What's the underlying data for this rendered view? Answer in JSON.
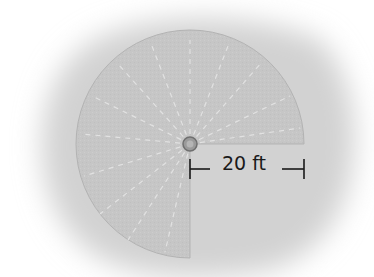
{
  "figure": {
    "shape": "three-quarter circle (270° sector), bottom-right quadrant removed",
    "radius_label": "20 ft",
    "colors": {
      "background": "#ffffff",
      "shadow": "#d2d2d2",
      "sector_fill": "#c6c6c6",
      "sector_edge": "#b3b3b3",
      "dash_lines": "#e4e4e4",
      "center_hub": "#8c8c8c",
      "dimension_line": "#1a1a1a"
    }
  }
}
